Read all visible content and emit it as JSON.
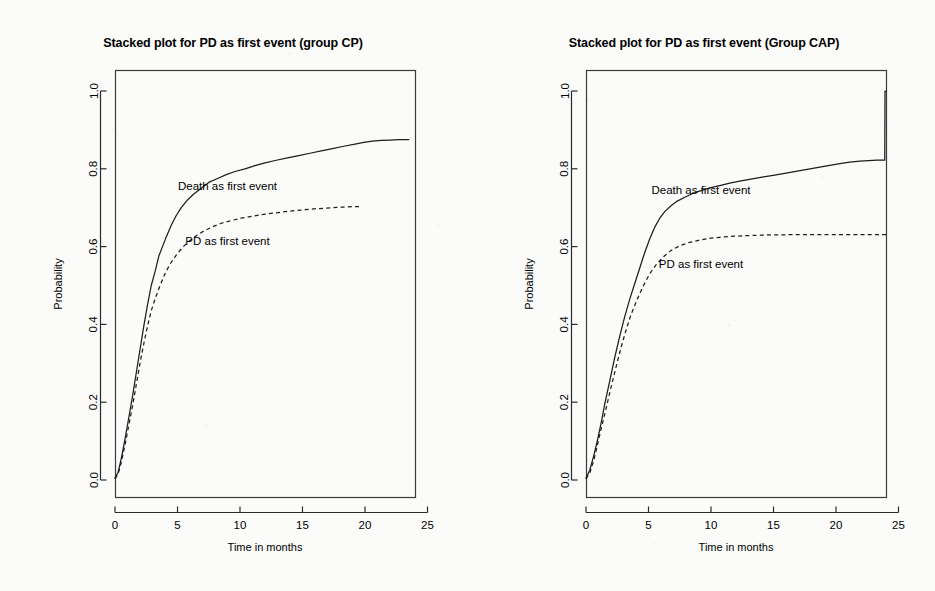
{
  "figure": {
    "background_color": "#fbfbfa",
    "ink_color": "#1d1d1d"
  },
  "chart_data": [
    {
      "type": "line",
      "panel": "left",
      "title": "Stacked plot for PD as first event (group CP)",
      "xlabel": "Time in months",
      "ylabel": "Probability",
      "xlim": [
        -1.2,
        26.0
      ],
      "ylim": [
        -0.03,
        1.03
      ],
      "xticks": [
        0,
        5,
        10,
        15,
        20,
        25
      ],
      "xticklabels": [
        "0",
        "5",
        "10",
        "15",
        "20",
        "25"
      ],
      "yticks": [
        0.0,
        0.2,
        0.4,
        0.6,
        0.8,
        1.0
      ],
      "yticklabels": [
        "0.0",
        "0.2",
        "0.4",
        "0.6",
        "0.8",
        "1.0"
      ],
      "grid": false,
      "legend": "inline-annotations",
      "annotations": [
        {
          "text": "Death as first event",
          "x": 9.0,
          "y": 0.745
        },
        {
          "text": "PD as first event",
          "x": 9.0,
          "y": 0.605
        }
      ],
      "series": [
        {
          "name": "Death as first event",
          "style": "solid",
          "x": [
            0.0,
            0.25,
            0.5,
            0.8,
            1.1,
            1.4,
            1.7,
            2.0,
            2.3,
            2.6,
            2.9,
            3.2,
            3.5,
            3.8,
            4.1,
            4.5,
            4.9,
            5.3,
            5.8,
            6.3,
            6.9,
            7.5,
            8.2,
            8.9,
            9.6,
            10.4,
            11.2,
            12.0,
            12.9,
            13.8,
            14.7,
            15.6,
            16.5,
            17.4,
            18.3,
            19.1,
            19.9,
            20.6,
            21.3,
            22.0,
            22.7,
            23.5
          ],
          "y": [
            0.005,
            0.02,
            0.055,
            0.105,
            0.16,
            0.215,
            0.275,
            0.335,
            0.395,
            0.45,
            0.5,
            0.535,
            0.575,
            0.6,
            0.625,
            0.655,
            0.68,
            0.7,
            0.72,
            0.735,
            0.75,
            0.765,
            0.775,
            0.785,
            0.793,
            0.8,
            0.808,
            0.815,
            0.822,
            0.828,
            0.834,
            0.84,
            0.846,
            0.852,
            0.858,
            0.863,
            0.868,
            0.871,
            0.873,
            0.874,
            0.875,
            0.875
          ]
        },
        {
          "name": "PD as first event",
          "style": "dashed",
          "x": [
            0.0,
            0.25,
            0.5,
            0.8,
            1.1,
            1.4,
            1.7,
            2.0,
            2.3,
            2.6,
            2.9,
            3.2,
            3.6,
            4.0,
            4.4,
            4.9,
            5.4,
            5.9,
            6.5,
            7.1,
            7.8,
            8.5,
            9.3,
            10.1,
            11.0,
            11.9,
            12.9,
            13.9,
            14.9,
            15.9,
            16.9,
            17.8,
            18.6,
            19.3,
            19.6
          ],
          "y": [
            0.003,
            0.015,
            0.045,
            0.09,
            0.14,
            0.19,
            0.245,
            0.3,
            0.35,
            0.395,
            0.435,
            0.465,
            0.5,
            0.53,
            0.555,
            0.578,
            0.598,
            0.613,
            0.628,
            0.64,
            0.651,
            0.66,
            0.667,
            0.673,
            0.678,
            0.683,
            0.687,
            0.691,
            0.694,
            0.697,
            0.699,
            0.701,
            0.702,
            0.703,
            0.703
          ]
        }
      ]
    },
    {
      "type": "line",
      "panel": "right",
      "title": "Stacked plot for PD as first event (Group CAP)",
      "xlabel": "Time in months",
      "ylabel": "Probability",
      "xlim": [
        -1.2,
        26.0
      ],
      "ylim": [
        -0.03,
        1.03
      ],
      "xticks": [
        0,
        5,
        10,
        15,
        20,
        25
      ],
      "xticklabels": [
        "0",
        "5",
        "10",
        "15",
        "20",
        "25"
      ],
      "yticks": [
        0.0,
        0.2,
        0.4,
        0.6,
        0.8,
        1.0
      ],
      "yticklabels": [
        "0.0",
        "0.2",
        "0.4",
        "0.6",
        "0.8",
        "1.0"
      ],
      "grid": false,
      "legend": "inline-annotations",
      "annotations": [
        {
          "text": "Death as first event",
          "x": 9.2,
          "y": 0.735
        },
        {
          "text": "PD as first event",
          "x": 9.2,
          "y": 0.545
        }
      ],
      "series": [
        {
          "name": "Death as first event",
          "style": "solid",
          "x": [
            0.0,
            0.3,
            0.6,
            0.9,
            1.2,
            1.5,
            1.9,
            2.3,
            2.7,
            3.1,
            3.5,
            3.9,
            4.3,
            4.7,
            5.1,
            5.5,
            5.9,
            6.3,
            6.8,
            7.3,
            7.9,
            8.5,
            9.2,
            9.9,
            10.7,
            11.5,
            12.4,
            13.3,
            14.2,
            15.1,
            16.0,
            16.9,
            17.8,
            18.7,
            19.5,
            20.3,
            21.1,
            21.9,
            22.6,
            23.3,
            23.9,
            23.92,
            24.0
          ],
          "y": [
            0.005,
            0.025,
            0.06,
            0.1,
            0.145,
            0.195,
            0.255,
            0.315,
            0.37,
            0.42,
            0.465,
            0.505,
            0.545,
            0.585,
            0.62,
            0.65,
            0.673,
            0.69,
            0.705,
            0.717,
            0.727,
            0.736,
            0.744,
            0.751,
            0.757,
            0.763,
            0.769,
            0.774,
            0.779,
            0.784,
            0.789,
            0.794,
            0.799,
            0.804,
            0.809,
            0.813,
            0.817,
            0.82,
            0.821,
            0.822,
            0.822,
            1.0,
            1.0
          ]
        },
        {
          "name": "PD as first event",
          "style": "dashed",
          "x": [
            0.0,
            0.3,
            0.6,
            0.9,
            1.2,
            1.6,
            2.0,
            2.4,
            2.8,
            3.2,
            3.6,
            4.1,
            4.6,
            5.1,
            5.6,
            6.2,
            6.8,
            7.5,
            8.2,
            9.0,
            9.8,
            10.7,
            11.6,
            12.6,
            13.6,
            14.6,
            15.6,
            16.6,
            17.6,
            18.6,
            19.6,
            20.6,
            21.6,
            22.6,
            23.5,
            24.0
          ],
          "y": [
            0.003,
            0.018,
            0.048,
            0.088,
            0.13,
            0.183,
            0.238,
            0.29,
            0.34,
            0.385,
            0.425,
            0.465,
            0.5,
            0.53,
            0.553,
            0.574,
            0.59,
            0.602,
            0.61,
            0.616,
            0.621,
            0.624,
            0.626,
            0.628,
            0.629,
            0.63,
            0.63,
            0.631,
            0.631,
            0.631,
            0.631,
            0.631,
            0.631,
            0.631,
            0.631,
            0.631
          ]
        }
      ]
    }
  ]
}
